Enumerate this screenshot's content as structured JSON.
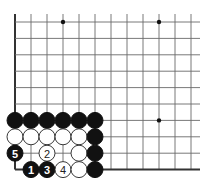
{
  "diagram": {
    "type": "go-board-corner",
    "grid": {
      "origin_x": 15,
      "origin_y": 22,
      "spacing_x": 16,
      "spacing_y": 16.4,
      "cols": 12,
      "rows": 10,
      "right_extent": 200
    },
    "edges": [
      "left",
      "bottom"
    ],
    "star_points": [
      {
        "col": 3,
        "row": 0
      },
      {
        "col": 9,
        "row": 0
      },
      {
        "col": 9,
        "row": 6
      }
    ],
    "stones": [
      {
        "col": 0,
        "row": 6,
        "color": "black",
        "label": ""
      },
      {
        "col": 1,
        "row": 6,
        "color": "black",
        "label": ""
      },
      {
        "col": 2,
        "row": 6,
        "color": "black",
        "label": ""
      },
      {
        "col": 3,
        "row": 6,
        "color": "black",
        "label": ""
      },
      {
        "col": 4,
        "row": 6,
        "color": "black",
        "label": ""
      },
      {
        "col": 5,
        "row": 6,
        "color": "black",
        "label": ""
      },
      {
        "col": 0,
        "row": 7,
        "color": "white",
        "label": ""
      },
      {
        "col": 1,
        "row": 7,
        "color": "white",
        "label": ""
      },
      {
        "col": 2,
        "row": 7,
        "color": "white",
        "label": ""
      },
      {
        "col": 3,
        "row": 7,
        "color": "white",
        "label": ""
      },
      {
        "col": 4,
        "row": 7,
        "color": "white",
        "label": ""
      },
      {
        "col": 5,
        "row": 7,
        "color": "black",
        "label": ""
      },
      {
        "col": 0,
        "row": 8,
        "color": "black",
        "label": "5"
      },
      {
        "col": 2,
        "row": 8,
        "color": "white",
        "label": "2"
      },
      {
        "col": 4,
        "row": 8,
        "color": "white",
        "label": ""
      },
      {
        "col": 5,
        "row": 8,
        "color": "black",
        "label": ""
      },
      {
        "col": 1,
        "row": 9,
        "color": "black",
        "label": "1"
      },
      {
        "col": 2,
        "row": 9,
        "color": "black",
        "label": "3"
      },
      {
        "col": 3,
        "row": 9,
        "color": "white",
        "label": "4"
      },
      {
        "col": 4,
        "row": 9,
        "color": "white",
        "label": ""
      },
      {
        "col": 5,
        "row": 9,
        "color": "black",
        "label": ""
      }
    ],
    "stone_radius": 8
  }
}
